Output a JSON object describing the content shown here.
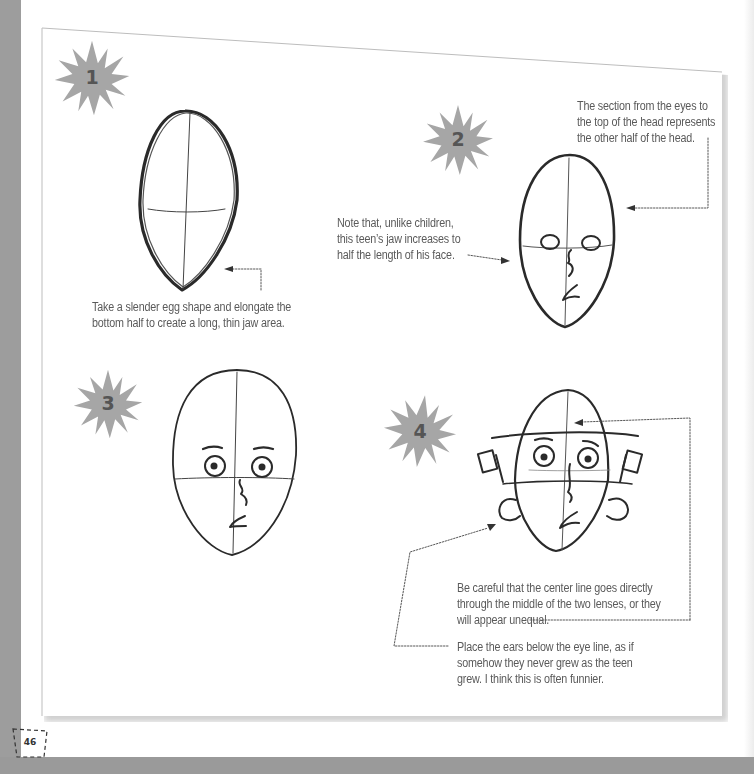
{
  "page": {
    "number": "46",
    "colors": {
      "frame_gray": "#9d9d9d",
      "starburst_gray": "#a6a6a6",
      "starburst_number": "#555555",
      "caption_text": "#5a5a5a",
      "sketch_line": "#2a2a2a"
    }
  },
  "steps": [
    {
      "number": "1",
      "captions": [
        {
          "text": "Take a slender egg shape and elongate the\nbottom half to create a long, thin jaw area."
        }
      ]
    },
    {
      "number": "2",
      "captions": [
        {
          "text": "The section from the eyes to\nthe top of the head represents\nthe other half of the head."
        },
        {
          "text": "Note that, unlike children,\nthis teen’s jaw increases to\nhalf the length of his face."
        }
      ]
    },
    {
      "number": "3",
      "captions": []
    },
    {
      "number": "4",
      "captions": [
        {
          "text": "Be careful that the center line goes directly\nthrough the middle of the two lenses, or they\nwill appear unequal."
        },
        {
          "text": "Place the ears below the eye line, as if\nsomehow they never grew as the teen\ngrew. I think this is often funnier."
        }
      ]
    }
  ]
}
